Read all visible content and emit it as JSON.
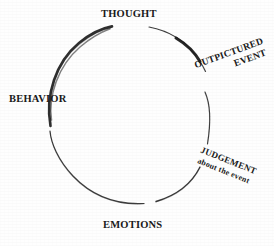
{
  "diagram": {
    "background_color": "#fefefe",
    "ink_color": "#1a1a1a",
    "circle": {
      "center_x": 130,
      "center_y": 114,
      "radius_x": 82,
      "radius_y": 89
    },
    "nodes": [
      {
        "id": "thought",
        "label": "THOUGHT",
        "position": "top",
        "angle_deg": 270,
        "rotation_deg": 0
      },
      {
        "id": "outpictured-event",
        "label": "OUTPICTURED",
        "label_line2": "EVENT",
        "position": "upper-right",
        "angle_deg": 325,
        "rotation_deg": -20
      },
      {
        "id": "judgement",
        "label": "JUDGEMENT",
        "label_line2": "about the event",
        "position": "lower-right",
        "angle_deg": 35,
        "rotation_deg": 22
      },
      {
        "id": "emotions",
        "label": "EMOTIONS",
        "position": "bottom",
        "angle_deg": 90,
        "rotation_deg": 0
      },
      {
        "id": "behavior",
        "label": "BEHAVIOR",
        "position": "left",
        "angle_deg": 180,
        "rotation_deg": 0
      }
    ],
    "arc_segments": [
      {
        "id": "thought-to-outpictured",
        "from": "thought",
        "to": "outpictured-event",
        "weight": "thick"
      },
      {
        "id": "outpictured-to-judgement",
        "from": "outpictured-event",
        "to": "judgement",
        "weight": "thin"
      },
      {
        "id": "judgement-to-emotions",
        "from": "judgement",
        "to": "emotions",
        "weight": "medium"
      },
      {
        "id": "emotions-to-behavior",
        "from": "emotions",
        "to": "behavior",
        "weight": "thin"
      },
      {
        "id": "behavior-to-thought",
        "from": "behavior",
        "to": "thought",
        "weight": "thick"
      }
    ]
  }
}
